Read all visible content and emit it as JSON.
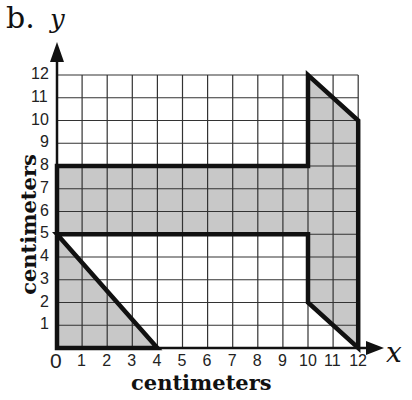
{
  "figure": {
    "panel_label": "b.",
    "x_axis_symbol": "x",
    "y_axis_symbol": "y",
    "x_axis_title": "centimeters",
    "y_axis_title": "centimeters",
    "x_ticks": [
      "0",
      "1",
      "2",
      "3",
      "4",
      "5",
      "6",
      "7",
      "8",
      "9",
      "10",
      "11",
      "12"
    ],
    "y_ticks": [
      "1",
      "2",
      "3",
      "4",
      "5",
      "6",
      "7",
      "8",
      "9",
      "10",
      "11",
      "12"
    ],
    "colors": {
      "grid": "#333333",
      "outline": "#111111",
      "fill": "#c8c8c8",
      "background": "#ffffff"
    }
  },
  "chart_data": {
    "type": "diagram",
    "title": "",
    "xlabel": "centimeters",
    "ylabel": "centimeters",
    "xlim": [
      0,
      12
    ],
    "ylim": [
      0,
      12
    ],
    "grid": true,
    "shaded_polygon": [
      [
        0,
        0
      ],
      [
        4,
        0
      ],
      [
        0,
        5
      ],
      [
        10,
        5
      ],
      [
        10,
        2
      ],
      [
        12,
        0
      ],
      [
        12,
        10
      ],
      [
        10,
        12
      ],
      [
        10,
        8
      ],
      [
        0,
        8
      ]
    ],
    "shaded_regions": [
      {
        "name": "lower-left triangle",
        "vertices": [
          [
            0,
            0
          ],
          [
            4,
            0
          ],
          [
            0,
            5
          ]
        ]
      },
      {
        "name": "horizontal bar",
        "vertices": [
          [
            0,
            5
          ],
          [
            10,
            5
          ],
          [
            10,
            8
          ],
          [
            0,
            8
          ]
        ]
      },
      {
        "name": "right column",
        "vertices": [
          [
            10,
            2
          ],
          [
            12,
            0
          ],
          [
            12,
            10
          ],
          [
            10,
            12
          ]
        ]
      }
    ]
  }
}
